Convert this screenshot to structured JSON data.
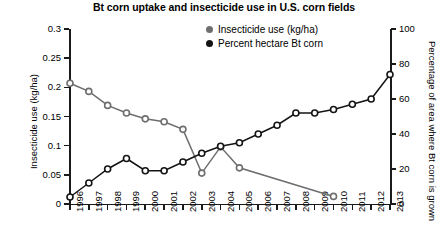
{
  "chart_data": {
    "type": "line",
    "title": "Bt corn uptake and insecticide use in U.S. corn fields",
    "xlabel": "",
    "ylabel": "Insecticide use (kg/ha)",
    "y2label": "Percentage of area where Bt corn is grown",
    "categories": [
      "1996",
      "1997",
      "1998",
      "1999",
      "2000",
      "2001",
      "2002",
      "2003",
      "2004",
      "2005",
      "2006",
      "2007",
      "2008",
      "2009",
      "2010",
      "2011",
      "2012",
      "2013"
    ],
    "ylim": [
      0,
      0.3
    ],
    "yticks": [
      "0",
      "0.05",
      "0.1",
      "0.15",
      "0.2",
      "0.25",
      "0.3"
    ],
    "y2lim": [
      0,
      100
    ],
    "y2ticks": [
      "0",
      "20",
      "40",
      "60",
      "80",
      "100"
    ],
    "grid": false,
    "legend_position": "top-right",
    "series": [
      {
        "name": "Insecticide use (kg/ha)",
        "axis": "left",
        "color": "#6e6e6e",
        "marker": "open-circle",
        "x": [
          "1996",
          "1997",
          "1998",
          "1999",
          "2000",
          "2001",
          "2002",
          "2003",
          "2004",
          "2005",
          "2010"
        ],
        "values": [
          0.207,
          0.193,
          0.169,
          0.156,
          0.146,
          0.141,
          0.128,
          0.053,
          0.098,
          0.062,
          0.013
        ]
      },
      {
        "name": "Percent hectare Bt corn",
        "axis": "right",
        "color": "#141414",
        "marker": "open-circle",
        "x": [
          "1996",
          "1997",
          "1998",
          "1999",
          "2000",
          "2001",
          "2002",
          "2003",
          "2004",
          "2005",
          "2006",
          "2007",
          "2008",
          "2009",
          "2010",
          "2011",
          "2012",
          "2013"
        ],
        "values": [
          4,
          12,
          20,
          26,
          19,
          19,
          24,
          29,
          33,
          35,
          40,
          45,
          52,
          52,
          54,
          57,
          60,
          74
        ]
      }
    ]
  },
  "legend": {
    "items": [
      {
        "label": "Insecticide use (kg/ha)",
        "color": "#6e6e6e"
      },
      {
        "label": "Percent hectare Bt corn",
        "color": "#141414"
      }
    ]
  }
}
